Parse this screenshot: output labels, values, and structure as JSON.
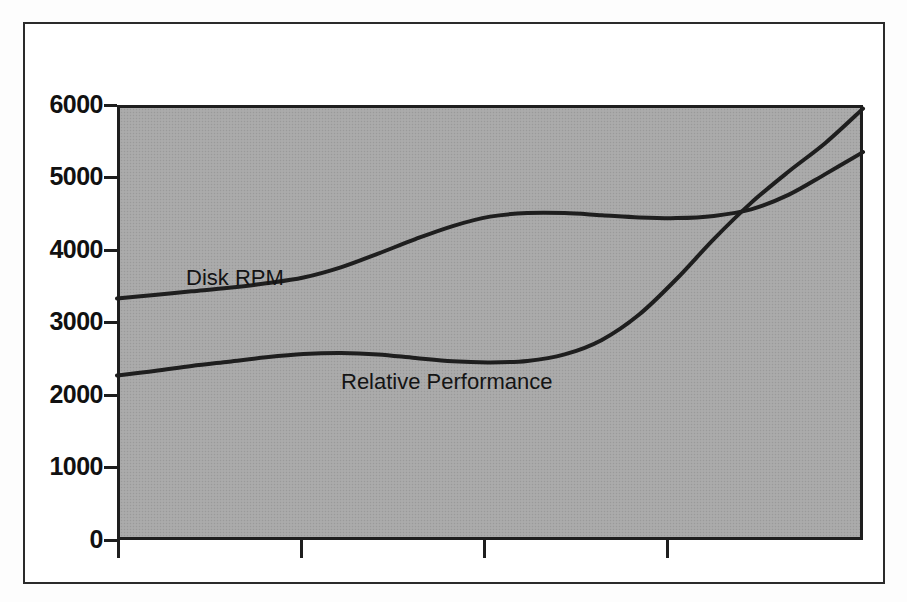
{
  "figure": {
    "background_color": "#ffffff",
    "frame_color": "#2b2b2b",
    "plot_background_color": "#a8a8a8",
    "line_color": "#1e1e1e"
  },
  "axes": {
    "y_ticks": [
      "6000",
      "5000",
      "4000",
      "3000",
      "2000",
      "1000",
      "0"
    ],
    "x_tick_count": 4
  },
  "labels": {
    "disk_rpm": "Disk RPM",
    "relative_performance": "Relative Performance"
  },
  "chart_data": {
    "type": "line",
    "title": "",
    "xlabel": "",
    "ylabel": "",
    "ylim": [
      0,
      6000
    ],
    "xlim": [
      0,
      100
    ],
    "grid": false,
    "legend": "inline-labels",
    "yticks": [
      0,
      1000,
      2000,
      3000,
      4000,
      5000,
      6000
    ],
    "xticks": [
      0,
      24.5,
      49,
      74.5
    ],
    "xticklabels": [
      "",
      "",
      "",
      ""
    ],
    "series": [
      {
        "name": "Disk RPM",
        "x": [
          0,
          5,
          10,
          15,
          20,
          25,
          30,
          35,
          40,
          45,
          50,
          55,
          60,
          65,
          70,
          75,
          80,
          85,
          90,
          95,
          100
        ],
        "values": [
          3330,
          3380,
          3430,
          3480,
          3540,
          3620,
          3760,
          3950,
          4150,
          4330,
          4460,
          4510,
          4510,
          4480,
          4450,
          4440,
          4470,
          4560,
          4760,
          5050,
          5350
        ]
      },
      {
        "name": "Relative Performance",
        "x": [
          0,
          5,
          10,
          15,
          20,
          25,
          30,
          35,
          40,
          45,
          50,
          55,
          60,
          65,
          70,
          75,
          80,
          85,
          90,
          95,
          100
        ],
        "values": [
          2270,
          2330,
          2400,
          2460,
          2520,
          2565,
          2580,
          2560,
          2510,
          2465,
          2450,
          2470,
          2560,
          2760,
          3110,
          3600,
          4150,
          4650,
          5080,
          5480,
          5950
        ]
      }
    ],
    "annotations": [
      {
        "text": "Disk RPM",
        "x": 10,
        "y": 3900
      },
      {
        "text": "Relative Performance",
        "x": 31,
        "y": 2330
      }
    ]
  }
}
